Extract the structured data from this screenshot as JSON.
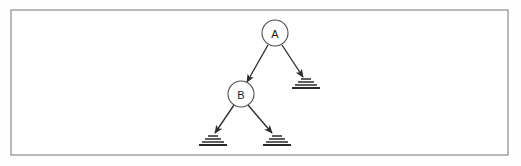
{
  "figure": {
    "background_color": "#fefefe",
    "frame": {
      "name": "outer-border",
      "x": 11,
      "y": 10,
      "width": 497,
      "height": 145,
      "stroke_color": "#8a8a8a",
      "fill_color": "#ffffff",
      "stroke_width": 1.2
    },
    "colors": {
      "node_stroke": "#4e4e4e",
      "node_fill": "#ffffff",
      "edge_stroke": "#2e2e2e",
      "terminal_stroke": "#2a2a2a",
      "label_text": "#1d1d1d"
    },
    "nodes": [
      {
        "id": "A",
        "label": "A",
        "cx": 275,
        "cy": 33,
        "r": 13,
        "kind": "circle-node"
      },
      {
        "id": "B",
        "label": "B",
        "cx": 241,
        "cy": 94,
        "r": 13,
        "kind": "circle-node"
      }
    ],
    "terminals": [
      {
        "id": "T1",
        "cx": 306,
        "cy": 83,
        "kind": "ground-stack",
        "bars": [
          {
            "half_width": 5,
            "dy": -4
          },
          {
            "half_width": 8,
            "dy": -1
          },
          {
            "half_width": 11,
            "dy": 2
          },
          {
            "half_width": 14,
            "dy": 5
          }
        ]
      },
      {
        "id": "T2",
        "cx": 213,
        "cy": 140,
        "kind": "ground-stack",
        "bars": [
          {
            "half_width": 5,
            "dy": -4
          },
          {
            "half_width": 8,
            "dy": -1
          },
          {
            "half_width": 11,
            "dy": 2
          },
          {
            "half_width": 14,
            "dy": 5
          }
        ]
      },
      {
        "id": "T3",
        "cx": 277,
        "cy": 140,
        "kind": "ground-stack",
        "bars": [
          {
            "half_width": 5,
            "dy": -4
          },
          {
            "half_width": 8,
            "dy": -1
          },
          {
            "half_width": 11,
            "dy": 2
          },
          {
            "half_width": 14,
            "dy": 5
          }
        ]
      }
    ],
    "edges": [
      {
        "id": "E1",
        "from": "A",
        "to": "B",
        "label": "",
        "x1": 268,
        "y1": 45,
        "x2": 247,
        "y2": 82
      },
      {
        "id": "E2",
        "from": "A",
        "to": "T1",
        "label": "",
        "x1": 282,
        "y1": 45,
        "x2": 303,
        "y2": 77
      },
      {
        "id": "E3",
        "from": "B",
        "to": "T2",
        "label": "",
        "x1": 234,
        "y1": 105,
        "x2": 215,
        "y2": 133
      },
      {
        "id": "E4",
        "from": "B",
        "to": "T3",
        "label": "",
        "x1": 248,
        "y1": 105,
        "x2": 272,
        "y2": 133
      }
    ]
  }
}
